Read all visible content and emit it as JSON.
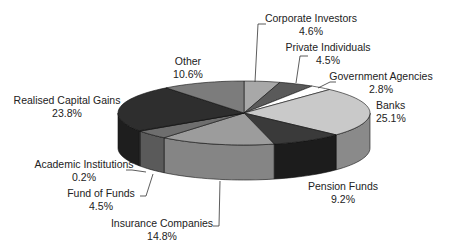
{
  "chart_data": {
    "type": "pie",
    "style": "3d-exploded-none",
    "title": "",
    "start": "top, clockwise",
    "slices": [
      {
        "label": "Corporate Investors",
        "value": 4.6,
        "pct": "4.6%",
        "color": "#a8a8a8",
        "side": "#8e8e8e"
      },
      {
        "label": "Private Individuals",
        "value": 4.5,
        "pct": "4.5%",
        "color": "#5a5a5a",
        "side": "#474747"
      },
      {
        "label": "Government Agencies",
        "value": 2.8,
        "pct": "2.8%",
        "color": "#ffffff",
        "side": "#e0e0e0"
      },
      {
        "label": "Banks",
        "value": 25.1,
        "pct": "25.1%",
        "color": "#c9c9c9",
        "side": "#8a8a8a"
      },
      {
        "label": "Pension Funds",
        "value": 9.2,
        "pct": "9.2%",
        "color": "#3a3a3a",
        "side": "#1c1c1c"
      },
      {
        "label": "Insurance Companies",
        "value": 14.8,
        "pct": "14.8%",
        "color": "#9c9c9c",
        "side": "#858585"
      },
      {
        "label": "Fund of Funds",
        "value": 4.5,
        "pct": "4.5%",
        "color": "#6e6e6e",
        "side": "#5a5a5a"
      },
      {
        "label": "Academic Institutions",
        "value": 0.2,
        "pct": "0.2%",
        "color": "#7a7a7a",
        "side": "#666666"
      },
      {
        "label": "Realised Capital Gains",
        "value": 23.8,
        "pct": "23.8%",
        "color": "#2e2e2e",
        "side": "#1e1e1e"
      },
      {
        "label": "Other",
        "value": 10.6,
        "pct": "10.6%",
        "color": "#7c7c7c",
        "side": "#656565"
      }
    ],
    "labels": [
      {
        "name": "Corporate Investors",
        "line1": "Corporate Investors",
        "line2": "4.6%",
        "x": 311,
        "y": 22,
        "anchor": "middle",
        "leader": [
          [
            255,
            82
          ],
          [
            258,
            24
          ],
          [
            266,
            24
          ]
        ]
      },
      {
        "name": "Private Individuals",
        "line1": "Private Individuals",
        "line2": "4.5%",
        "x": 328,
        "y": 51,
        "anchor": "middle",
        "leader": [
          [
            296,
            83
          ],
          [
            300,
            56
          ],
          [
            308,
            56
          ]
        ]
      },
      {
        "name": "Government Agencies",
        "line1": "Government Agencies",
        "line2": "2.8%",
        "x": 381,
        "y": 80,
        "anchor": "middle",
        "leader": [
          [
            318,
            88
          ],
          [
            330,
            82
          ],
          [
            336,
            82
          ]
        ]
      },
      {
        "name": "Banks",
        "line1": "Banks",
        "line2": "25.1%",
        "x": 376,
        "y": 109,
        "anchor": "start",
        "leader": null
      },
      {
        "name": "Pension Funds",
        "line1": "Pension Funds",
        "line2": "9.2%",
        "x": 343,
        "y": 190,
        "anchor": "middle",
        "leader": null
      },
      {
        "name": "Insurance Companies",
        "line1": "Insurance Companies",
        "line2": "14.8%",
        "x": 162,
        "y": 227,
        "anchor": "middle",
        "leader": [
          [
            220,
            181
          ],
          [
            219,
            226
          ],
          [
            213,
            226
          ]
        ]
      },
      {
        "name": "Fund of Funds",
        "line1": "Fund of Funds",
        "line2": "4.5%",
        "x": 101,
        "y": 197,
        "anchor": "middle",
        "leader": [
          [
            153,
            174
          ],
          [
            146,
            196
          ],
          [
            140,
            196
          ]
        ]
      },
      {
        "name": "Academic Institutions",
        "line1": "Academic Institutions",
        "line2": "0.2%",
        "x": 84,
        "y": 168,
        "anchor": "middle",
        "leader": [
          [
            146,
            172
          ],
          [
            132,
            170
          ],
          [
            126,
            170
          ]
        ]
      },
      {
        "name": "Realised Capital Gains",
        "line1": "Realised Capital Gains",
        "line2": "23.8%",
        "x": 67,
        "y": 104,
        "anchor": "middle",
        "leader": null
      },
      {
        "name": "Other",
        "line1": "Other",
        "line2": "10.6%",
        "x": 188,
        "y": 65,
        "anchor": "middle",
        "leader": null
      }
    ],
    "geometry": {
      "cx": 244,
      "cy": 113,
      "rx": 126,
      "ry": 32,
      "depth": 35
    }
  }
}
